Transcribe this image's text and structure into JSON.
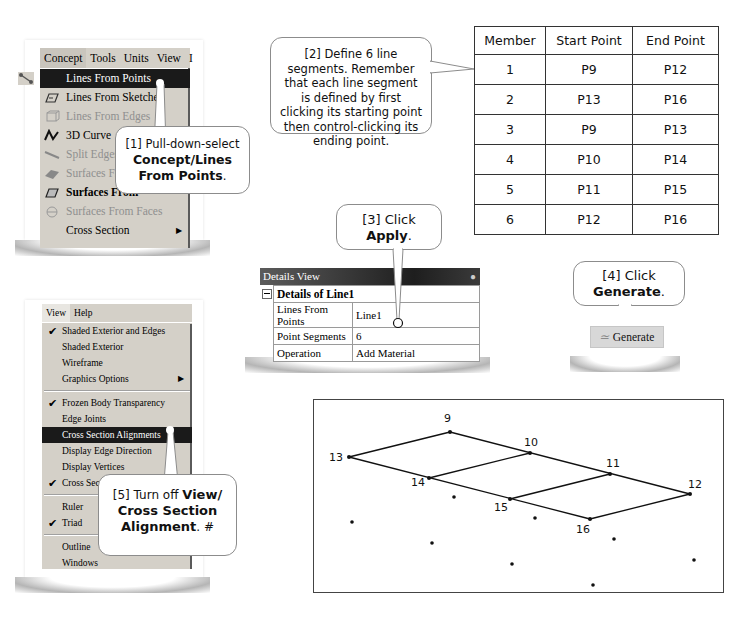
{
  "concept_menu": {
    "menubar": [
      "Concept",
      "Tools",
      "Units",
      "View",
      "I"
    ],
    "items": [
      {
        "label": "Lines From Points",
        "icon": "line-points-icon",
        "state": "selected"
      },
      {
        "label": "Lines From Sketches",
        "icon": "line-sketch-icon",
        "state": "enabled"
      },
      {
        "label": "Lines From Edges",
        "icon": "line-edges-icon",
        "state": "disabled"
      },
      {
        "label": "3D Curve",
        "icon": "curve-3d-icon",
        "state": "enabled"
      },
      {
        "label": "Split Edges",
        "icon": "split-edges-icon",
        "state": "disabled"
      },
      {
        "label": "Surfaces From",
        "icon": "surface-sketch-icon",
        "state": "disabled"
      },
      {
        "label": "Surfaces From",
        "icon": "surface-edges-icon",
        "state": "enabled"
      },
      {
        "label": "Surfaces From Faces",
        "icon": "surface-faces-icon",
        "state": "disabled"
      },
      {
        "label": "Cross Section",
        "icon": "",
        "state": "submenu"
      }
    ]
  },
  "callouts": {
    "c1": {
      "prefix": "[1] Pull-down-select",
      "bold": "Concept/Lines From Points",
      "suffix": "."
    },
    "c2": {
      "text": "[2] Define 6 line segments. Remember that each line segment is defined by first clicking its starting point then control-clicking its ending point."
    },
    "c3": {
      "prefix": "[3] Click",
      "bold": "Apply",
      "suffix": "."
    },
    "c4": {
      "prefix": "[4] Click",
      "bold": "Generate",
      "suffix": "."
    },
    "c5": {
      "prefix": "[5] Turn off",
      "bold": "View/ Cross Section Alignment",
      "suffix": ". #"
    }
  },
  "members_table": {
    "headers": [
      "Member",
      "Start Point",
      "End Point"
    ],
    "rows": [
      [
        "1",
        "P9",
        "P12"
      ],
      [
        "2",
        "P13",
        "P16"
      ],
      [
        "3",
        "P9",
        "P13"
      ],
      [
        "4",
        "P10",
        "P14"
      ],
      [
        "5",
        "P11",
        "P15"
      ],
      [
        "6",
        "P12",
        "P16"
      ]
    ]
  },
  "details_view": {
    "title": "Details View",
    "pin_icon": "pin-icon",
    "section": "Details of Line1",
    "rows": [
      {
        "label": "Lines From Points",
        "value": "Line1"
      },
      {
        "label": "Point Segments",
        "value": "6"
      },
      {
        "label": "Operation",
        "value": "Add Material"
      }
    ]
  },
  "generate_button": {
    "label": "Generate",
    "icon": "lightning-icon"
  },
  "view_menu": {
    "menubar": [
      "View",
      "Help"
    ],
    "items": [
      {
        "label": "Shaded Exterior and Edges",
        "checked": true
      },
      {
        "label": "Shaded Exterior",
        "checked": false
      },
      {
        "label": "Wireframe",
        "checked": false
      },
      {
        "label": "Graphics Options",
        "checked": false,
        "submenu": true,
        "sep_after": true
      },
      {
        "label": "Frozen Body Transparency",
        "checked": true
      },
      {
        "label": "Edge Joints",
        "checked": false
      },
      {
        "label": "Cross Section Alignments",
        "checked": false,
        "selected": true
      },
      {
        "label": "Display Edge Direction",
        "checked": false
      },
      {
        "label": "Display Vertices",
        "checked": false
      },
      {
        "label": "Cross Section Solids",
        "checked": true,
        "sep_after": true
      },
      {
        "label": "Ruler",
        "checked": false
      },
      {
        "label": "Triad",
        "checked": true,
        "sep_after": true
      },
      {
        "label": "Outline",
        "checked": false
      },
      {
        "label": "Windows",
        "checked": false
      }
    ]
  },
  "graphics": {
    "labels": [
      {
        "id": "9",
        "text": "9"
      },
      {
        "id": "10",
        "text": "10"
      },
      {
        "id": "11",
        "text": "11"
      },
      {
        "id": "12",
        "text": "12"
      },
      {
        "id": "13",
        "text": "13"
      },
      {
        "id": "14",
        "text": "14"
      },
      {
        "id": "15",
        "text": "15"
      },
      {
        "id": "16",
        "text": "16"
      }
    ]
  }
}
